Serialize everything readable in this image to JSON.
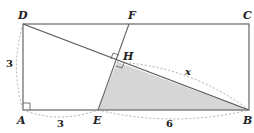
{
  "diagram": {
    "type": "geometry",
    "points": {
      "A": {
        "label": "A"
      },
      "B": {
        "label": "B"
      },
      "C": {
        "label": "C"
      },
      "D": {
        "label": "D"
      },
      "E": {
        "label": "E"
      },
      "F": {
        "label": "F"
      },
      "H": {
        "label": "H"
      }
    },
    "measures": {
      "AD": "3",
      "AE": "3",
      "EB": "6",
      "HB": "x"
    },
    "colors": {
      "stroke": "#666666",
      "fill_shaded": "#d6d6d6",
      "dashed": "#999999"
    }
  }
}
